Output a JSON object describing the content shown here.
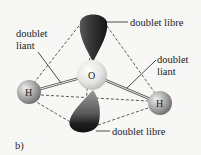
{
  "diagram": {
    "panel_label": "b)",
    "atoms": {
      "center": "O",
      "left": "H",
      "right": "H"
    },
    "labels": {
      "lone_pair_top": "doublet libre",
      "lone_pair_bottom": "doublet libre",
      "bond_left_line1": "doublet",
      "bond_left_line2": "liant",
      "bond_right_line1": "doublet",
      "bond_right_line2": "liant"
    },
    "colors": {
      "background": "#f7f7f5",
      "lobe_dark": "#2a2a2a",
      "atom_grey": "#bdbdbd",
      "oxygen": "#e6e6e4",
      "line": "#222222"
    }
  }
}
